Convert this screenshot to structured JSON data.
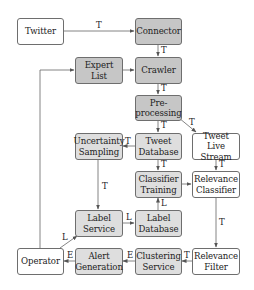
{
  "diagram": {
    "nodes": {
      "twitter": {
        "label": "Twitter",
        "style": "white"
      },
      "connector": {
        "label": "Connector",
        "style": "dark"
      },
      "expert_list": {
        "label": "Expert List",
        "style": "dark"
      },
      "crawler": {
        "label": "Crawler",
        "style": "dark"
      },
      "preprocessing": {
        "label": "Pre-\nprocessing",
        "style": "dark"
      },
      "uncertainty_sampling": {
        "label": "Uncertainty\nSampling",
        "style": "light"
      },
      "tweet_database": {
        "label": "Tweet\nDatabase",
        "style": "light"
      },
      "tweet_live_stream": {
        "label": "Tweet Live\nStream",
        "style": "white"
      },
      "classifier_training": {
        "label": "Classifier\nTraining",
        "style": "light"
      },
      "relevance_classifier": {
        "label": "Relevance\nClassifier",
        "style": "white"
      },
      "label_service": {
        "label": "Label\nService",
        "style": "light"
      },
      "label_database": {
        "label": "Label\nDatabase",
        "style": "light"
      },
      "operator": {
        "label": "Operator",
        "style": "white"
      },
      "alert_generation": {
        "label": "Alert\nGeneration",
        "style": "light"
      },
      "clustering_service": {
        "label": "Clustering\nService",
        "style": "light"
      },
      "relevance_filter": {
        "label": "Relevance\nFilter",
        "style": "white"
      }
    },
    "edges": [
      {
        "from": "Twitter",
        "to": "Connector",
        "label": "T"
      },
      {
        "from": "Connector",
        "to": "Crawler",
        "label": "T"
      },
      {
        "from": "Expert List",
        "to": "Crawler",
        "label": ""
      },
      {
        "from": "Crawler",
        "to": "Pre-processing",
        "label": "T"
      },
      {
        "from": "Pre-processing",
        "to": "Tweet Database",
        "label": "T"
      },
      {
        "from": "Pre-processing",
        "to": "Tweet Live Stream",
        "label": "T"
      },
      {
        "from": "Tweet Database",
        "to": "Uncertainty Sampling",
        "label": "T"
      },
      {
        "from": "Tweet Database",
        "to": "Classifier Training",
        "label": "T"
      },
      {
        "from": "Tweet Live Stream",
        "to": "Relevance Classifier",
        "label": "T"
      },
      {
        "from": "Classifier Training",
        "to": "Relevance Classifier",
        "label": ""
      },
      {
        "from": "Uncertainty Sampling",
        "to": "Label Service",
        "label": "T"
      },
      {
        "from": "Label Service",
        "to": "Label Database",
        "label": "L"
      },
      {
        "from": "Label Database",
        "to": "Classifier Training",
        "label": "L"
      },
      {
        "from": "Relevance Classifier",
        "to": "Relevance Filter",
        "label": "T"
      },
      {
        "from": "Relevance Filter",
        "to": "Clustering Service",
        "label": "T"
      },
      {
        "from": "Clustering Service",
        "to": "Alert Generation",
        "label": "E"
      },
      {
        "from": "Alert Generation",
        "to": "Operator",
        "label": "E"
      },
      {
        "from": "Operator",
        "to": "Label Service",
        "label": "L"
      },
      {
        "from": "Operator",
        "to": "Expert List",
        "label": ""
      }
    ],
    "edge_labels": {
      "t": "T",
      "l": "L",
      "e": "E"
    }
  }
}
